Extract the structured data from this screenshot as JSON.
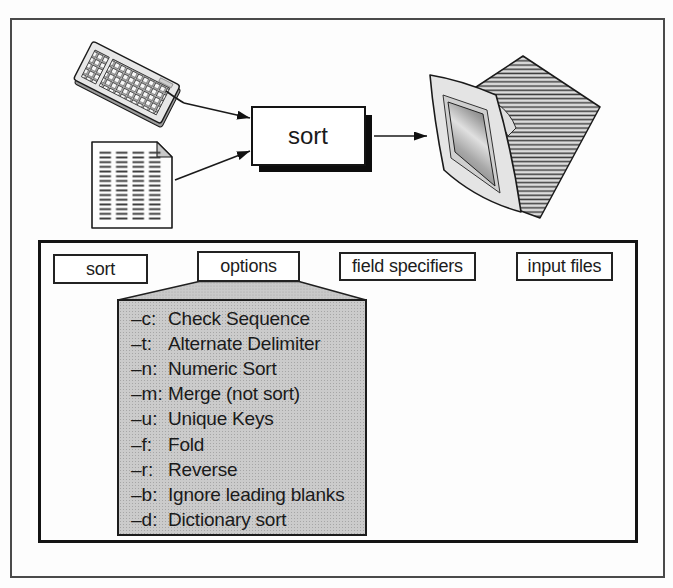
{
  "figure": {
    "title_hint": "sort command data flow and syntax"
  },
  "flow": {
    "process_label": "sort",
    "input_icons": [
      {
        "name": "keyboard-icon"
      },
      {
        "name": "document-icon"
      }
    ],
    "output_icon": {
      "name": "monitor-icon"
    }
  },
  "syntax": {
    "segments": [
      {
        "label": "sort"
      },
      {
        "label": "options"
      },
      {
        "label": "field specifiers"
      },
      {
        "label": "input files"
      }
    ],
    "options_panel": {
      "items": [
        {
          "flag": "–c:",
          "desc": "Check Sequence"
        },
        {
          "flag": "–t:",
          "desc": "Alternate Delimiter"
        },
        {
          "flag": "–n:",
          "desc": "Numeric Sort"
        },
        {
          "flag": "–m:",
          "desc": "Merge (not sort)"
        },
        {
          "flag": "–u:",
          "desc": "Unique Keys"
        },
        {
          "flag": "–f:",
          "desc": "Fold"
        },
        {
          "flag": "–r:",
          "desc": "Reverse"
        },
        {
          "flag": "–b:",
          "desc": "Ignore leading blanks"
        },
        {
          "flag": "–d:",
          "desc": "Dictionary sort"
        }
      ]
    }
  },
  "colors": {
    "ink": "#1a1a1a",
    "panel_gray": "#cbcbcb",
    "shadow_black": "#0d0d0d",
    "paper_white": "#fdfdfd"
  }
}
